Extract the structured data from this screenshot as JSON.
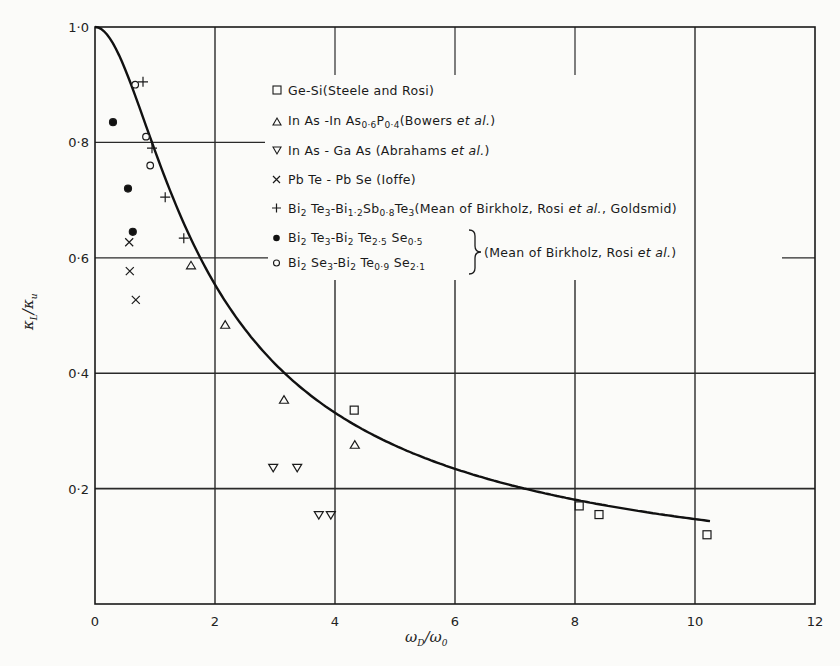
{
  "chart_data": {
    "type": "scatter",
    "title": "",
    "xlabel": "ωD/ω0",
    "ylabel": "κL/κu",
    "xlim": [
      0,
      12
    ],
    "ylim": [
      0,
      1.0
    ],
    "x_ticks": [
      "0",
      "2",
      "4",
      "6",
      "8",
      "10",
      "12"
    ],
    "y_ticks": [
      "0·2",
      "0·4",
      "0·6",
      "0·8",
      "1·0"
    ],
    "grid": true,
    "legend_position": "upper-center",
    "theory_curve": {
      "name": "κL/κu = (ω0/ωD)·arctan(ωD/ω0)",
      "x": [
        0,
        0.5,
        1,
        1.5,
        2,
        3,
        4,
        5,
        6,
        7,
        8,
        9,
        10,
        10.3
      ],
      "y": [
        1.0,
        0.927,
        0.785,
        0.655,
        0.554,
        0.416,
        0.331,
        0.275,
        0.235,
        0.204,
        0.181,
        0.163,
        0.147,
        0.143
      ]
    },
    "series": [
      {
        "name": "Ge-Si (Steele and Rosi)",
        "marker": "square",
        "points": [
          [
            4.32,
            0.336
          ],
          [
            8.07,
            0.17
          ],
          [
            8.4,
            0.155
          ],
          [
            10.2,
            0.12
          ]
        ]
      },
      {
        "name": "InAs-InAs0·6P0·4 (Bowers et al.)",
        "marker": "triangle-up",
        "points": [
          [
            1.6,
            0.587
          ],
          [
            2.17,
            0.484
          ],
          [
            3.15,
            0.354
          ],
          [
            4.33,
            0.276
          ]
        ]
      },
      {
        "name": "InAs-GaAs (Abrahams et al.)",
        "marker": "triangle-down",
        "points": [
          [
            2.97,
            0.236
          ],
          [
            3.37,
            0.236
          ],
          [
            3.73,
            0.154
          ],
          [
            3.93,
            0.154
          ]
        ]
      },
      {
        "name": "PbTe-PbSe (Ioffe)",
        "marker": "x",
        "points": [
          [
            0.57,
            0.627
          ],
          [
            0.58,
            0.577
          ],
          [
            0.68,
            0.527
          ]
        ]
      },
      {
        "name": "Bi2Te3-Bi1·2Sb0·8Te3 (Mean of Birkholz, Rosi et al., Goldsmid)",
        "marker": "plus",
        "points": [
          [
            0.8,
            0.905
          ],
          [
            0.95,
            0.79
          ],
          [
            1.17,
            0.705
          ],
          [
            1.48,
            0.634
          ]
        ]
      },
      {
        "name": "Bi2Te3-Bi2Te2·5Se0·5 (Mean of Birkholz, Rosi et al.)",
        "marker": "filled-circle",
        "points": [
          [
            0.3,
            0.835
          ],
          [
            0.55,
            0.72
          ],
          [
            0.63,
            0.645
          ]
        ]
      },
      {
        "name": "Bi2Se3-Bi2Te0·9Se2·1 (Mean of Birkholz, Rosi et al.)",
        "marker": "open-circle",
        "points": [
          [
            0.67,
            0.9
          ],
          [
            0.85,
            0.81
          ],
          [
            0.92,
            0.76
          ]
        ]
      }
    ]
  },
  "legend": {
    "ge_si": "Ge-Si(Steele and Rosi)",
    "inas_inasp": {
      "a": "In As -In As",
      "s1": "0·6",
      "b": "P",
      "s2": "0·4",
      "c": "(Bowers ",
      "it": "et al.",
      "d": ")"
    },
    "inas_gaas": {
      "a": "In As - Ga As (Abrahams ",
      "it": "et al.",
      "b": ")"
    },
    "pbte": "Pb Te - Pb Se (Ioffe)",
    "bite_bisbte": {
      "a": "Bi",
      "s1": "2",
      "b": " Te",
      "s2": "3",
      "c": "-Bi",
      "s3": "1·2",
      "d": "Sb",
      "s4": "0·8",
      "e": "Te",
      "s5": "3",
      "f": "(Mean of Birkholz, Rosi ",
      "it": "et al.",
      "g": ", Goldsmid)"
    },
    "bite_bitese": {
      "a": "Bi",
      "s1": "2",
      "b": " Te",
      "s2": "3",
      "c": "-Bi",
      "s3": "2",
      "d": " Te",
      "s4": "2·5",
      "e": " Se",
      "s5": "0·5"
    },
    "bise_bitese": {
      "a": "Bi",
      "s1": "2",
      "b": " Se",
      "s2": "3",
      "c": "-Bi",
      "s3": "2",
      "d": " Te",
      "s4": "0·9",
      "e": " Se",
      "s5": "2·1"
    },
    "brace_note": {
      "a": "(Mean of Birkholz, Rosi ",
      "it": "et al.",
      "b": ")"
    }
  },
  "axes": {
    "xlabel_main": "ω",
    "xlabel_sub1": "D",
    "xlabel_slash": "/ω",
    "xlabel_sub2": "0",
    "ylabel_main": "κ",
    "ylabel_sub1": "L",
    "ylabel_slash": "/κ",
    "ylabel_sub2": "u"
  }
}
